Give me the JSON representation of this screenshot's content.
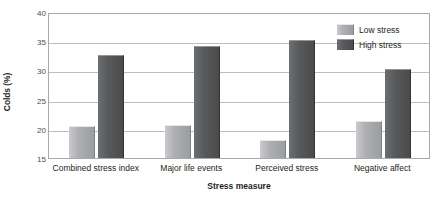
{
  "chart_data": {
    "type": "bar",
    "title": "",
    "xlabel": "Stress measure",
    "ylabel": "Colds (%)",
    "categories": [
      "Combined stress index",
      "Major life events",
      "Perceived stress",
      "Negative affect"
    ],
    "series": [
      {
        "name": "Low stress",
        "color": "#a8aaad",
        "values": [
          20.5,
          20.6,
          18.0,
          21.4
        ]
      },
      {
        "name": "High stress",
        "color": "#58595b",
        "values": [
          32.6,
          34.1,
          35.2,
          30.3
        ]
      }
    ],
    "ylim": [
      15,
      40
    ],
    "yticks": [
      15,
      20,
      25,
      30,
      35,
      40
    ],
    "ytick_labels": [
      "15",
      "20",
      "25",
      "30",
      "35",
      "40"
    ],
    "grid": true,
    "legend_position": "top-right",
    "legend_entries": [
      "Low stress",
      "High stress"
    ]
  }
}
